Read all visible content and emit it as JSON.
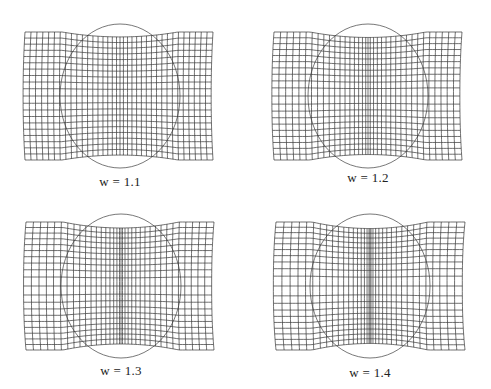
{
  "figure": {
    "panels": [
      {
        "label": "w = 1.1",
        "w": 1.1,
        "grid": {
          "x0": 25,
          "x1": 213,
          "y0": 32,
          "y1": 160
        },
        "circle": {
          "cx": 120,
          "top": 24,
          "bottom": 168,
          "halfwidth": 58
        },
        "label_pos": {
          "x": 120,
          "y": 174
        }
      },
      {
        "label": "w = 1.2",
        "w": 1.2,
        "grid": {
          "x0": 274,
          "x1": 462,
          "y0": 32,
          "y1": 160
        },
        "circle": {
          "cx": 368,
          "top": 24,
          "bottom": 168,
          "halfwidth": 58
        },
        "label_pos": {
          "x": 368,
          "y": 170
        }
      },
      {
        "label": "w = 1.3",
        "w": 1.3,
        "grid": {
          "x0": 26,
          "x1": 214,
          "y0": 222,
          "y1": 350
        },
        "circle": {
          "cx": 121,
          "top": 214,
          "bottom": 358,
          "halfwidth": 58
        },
        "label_pos": {
          "x": 121,
          "y": 363
        }
      },
      {
        "label": "w = 1.4",
        "w": 1.4,
        "grid": {
          "x0": 276,
          "x1": 465,
          "y0": 222,
          "y1": 350
        },
        "circle": {
          "cx": 370,
          "top": 214,
          "bottom": 358,
          "halfwidth": 58
        },
        "label_pos": {
          "x": 370,
          "y": 365
        }
      }
    ],
    "grid_lines": {
      "vertical": 36,
      "horizontal": 20
    },
    "colors": {
      "line": "#333333",
      "circle": "#555555",
      "background": "#ffffff"
    }
  }
}
